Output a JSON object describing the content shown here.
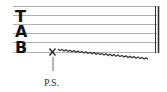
{
  "notation": {
    "type": "guitar-tablature",
    "clef_letters": [
      "T",
      "A",
      "B"
    ],
    "string_count": 6,
    "technique": {
      "marker": "X",
      "label": "P.S.",
      "string": 6,
      "effect": "wavy-descending-line"
    },
    "barline": "double",
    "colors": {
      "staff_lines": "#b0b0b0",
      "ink": "#222222",
      "background": "#ffffff"
    }
  }
}
